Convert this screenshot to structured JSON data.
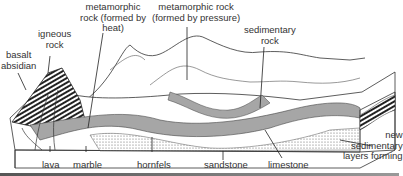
{
  "diagram": {
    "labels": {
      "metamorphic_heat": [
        "metamorphic",
        "rock (formed by",
        "heat)"
      ],
      "metamorphic_pressure": [
        "metamorphic rock",
        "(formed by pressure)"
      ],
      "igneous": [
        "igneous",
        "rock"
      ],
      "basalt": [
        "basalt",
        "absidian"
      ],
      "sedimentary": [
        "sedimentary",
        "rock"
      ],
      "new_layers": [
        "new",
        "sedimentary",
        "layers forming"
      ],
      "lava": "lava",
      "marble": "marble",
      "hornfels": "hornfels",
      "sandstone": "sandstone",
      "limestone": "limestone"
    }
  }
}
